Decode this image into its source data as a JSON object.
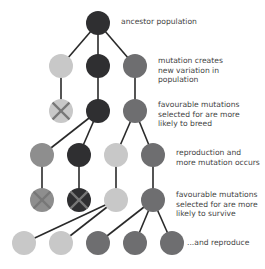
{
  "colors": {
    "black": "#2f2f31",
    "dark": "#6e6e70",
    "light": "#c8c8c8",
    "mid": "#8e8e8e",
    "edge": "#2a2a2a",
    "cross": "#777777"
  },
  "nodes": [
    {
      "id": "root",
      "x": 98,
      "y": 23,
      "shade": "black",
      "crossed": false
    },
    {
      "id": "g1a",
      "x": 61,
      "y": 66,
      "shade": "light",
      "crossed": false
    },
    {
      "id": "g1b",
      "x": 98,
      "y": 66,
      "shade": "black",
      "crossed": false
    },
    {
      "id": "g1c",
      "x": 135,
      "y": 66,
      "shade": "dark",
      "crossed": false
    },
    {
      "id": "s1a",
      "x": 61,
      "y": 111,
      "shade": "light",
      "crossed": true
    },
    {
      "id": "s1b",
      "x": 98,
      "y": 111,
      "shade": "black",
      "crossed": false
    },
    {
      "id": "s1c",
      "x": 135,
      "y": 111,
      "shade": "dark",
      "crossed": false
    },
    {
      "id": "g2a",
      "x": 42,
      "y": 155,
      "shade": "mid",
      "crossed": false
    },
    {
      "id": "g2b",
      "x": 79,
      "y": 155,
      "shade": "black",
      "crossed": false
    },
    {
      "id": "g2c",
      "x": 116,
      "y": 155,
      "shade": "light",
      "crossed": false
    },
    {
      "id": "g2d",
      "x": 153,
      "y": 155,
      "shade": "dark",
      "crossed": false
    },
    {
      "id": "s2a",
      "x": 42,
      "y": 200,
      "shade": "mid",
      "crossed": true
    },
    {
      "id": "s2b",
      "x": 79,
      "y": 200,
      "shade": "black",
      "crossed": true
    },
    {
      "id": "s2c",
      "x": 116,
      "y": 200,
      "shade": "light",
      "crossed": false
    },
    {
      "id": "s2d",
      "x": 153,
      "y": 200,
      "shade": "dark",
      "crossed": false
    },
    {
      "id": "g3a",
      "x": 24,
      "y": 243,
      "shade": "light",
      "crossed": false
    },
    {
      "id": "g3b",
      "x": 61,
      "y": 243,
      "shade": "light",
      "crossed": false
    },
    {
      "id": "g3c",
      "x": 98,
      "y": 243,
      "shade": "dark",
      "crossed": false
    },
    {
      "id": "g3d",
      "x": 135,
      "y": 243,
      "shade": "dark",
      "crossed": false
    },
    {
      "id": "g3e",
      "x": 172,
      "y": 243,
      "shade": "dark",
      "crossed": false
    }
  ],
  "edges": [
    [
      "root",
      "g1a"
    ],
    [
      "root",
      "g1b"
    ],
    [
      "root",
      "g1c"
    ],
    [
      "g1a",
      "s1a"
    ],
    [
      "g1b",
      "s1b"
    ],
    [
      "g1c",
      "s1c"
    ],
    [
      "s1b",
      "g2a"
    ],
    [
      "s1b",
      "g2b"
    ],
    [
      "s1c",
      "g2c"
    ],
    [
      "s1c",
      "g2d"
    ],
    [
      "g2a",
      "s2a"
    ],
    [
      "g2b",
      "s2b"
    ],
    [
      "g2c",
      "s2c"
    ],
    [
      "g2d",
      "s2d"
    ],
    [
      "s2c",
      "g3a"
    ],
    [
      "s2c",
      "g3b"
    ],
    [
      "s2d",
      "g3c"
    ],
    [
      "s2d",
      "g3d"
    ],
    [
      "s2d",
      "g3e"
    ]
  ],
  "labels": {
    "ancestor": "ancestor population",
    "mutation": "mutation creates\nnew variation in\npopulation",
    "selected_breed": "favourable mutations\nselected for are more\nlikely to breed",
    "reproduction": "reproduction and\nmore mutation occurs",
    "selected_survive": "favourable mutations\nselected for are more\nlikely to survive",
    "reproduce": "...and reproduce"
  }
}
